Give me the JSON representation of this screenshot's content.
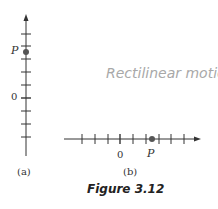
{
  "figure": {
    "caption": "Figure 3.12",
    "watermark": "Rectilinear motion",
    "colors": {
      "ink": "#333333",
      "point": "#555555",
      "watermark": "#a8a8a8",
      "caption": "#222222"
    },
    "panel_a": {
      "label": "(a)",
      "orientation": "vertical",
      "origin_label": "0",
      "point_label": "P",
      "tick_count": 9,
      "point_position_units": 3.5
    },
    "panel_b": {
      "label": "(b)",
      "orientation": "horizontal",
      "origin_label": "0",
      "point_label": "P",
      "tick_count": 9,
      "point_position_units": 2.5
    }
  }
}
